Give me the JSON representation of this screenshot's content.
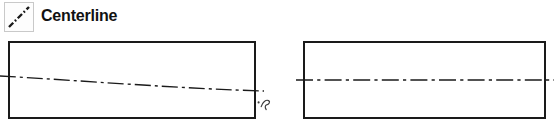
{
  "legend": {
    "swatch_icon": "centerline-dash-dot-diagonal-icon",
    "label": "Centerline",
    "line_color": "#1a1a1a",
    "swatch_border_color": "#c9c9c9",
    "swatch_fill_color": "#fdfdfd"
  },
  "drawing": {
    "outline_color": "#1a1a1a",
    "fill_color": "#ffffff",
    "centerline_color": "#1a1a1a",
    "annotation_color": "#3d3d3d",
    "figures": [
      {
        "name": "left-part-sloping-centerline",
        "caption": "",
        "rect": {
          "x": 9,
          "y": 6,
          "width": 246,
          "height": 76
        },
        "centerline_style": "dash-dot",
        "centerline_kind": "freehand-sloping",
        "centerline_start": {
          "x": 0,
          "y": 40
        },
        "centerline_end": {
          "x": 264,
          "y": 55
        },
        "annotation_mark": "squiggle-arrow"
      },
      {
        "name": "right-part-horizontal-centerline",
        "caption": "",
        "rect": {
          "x": 8,
          "y": 6,
          "width": 241,
          "height": 76
        },
        "centerline_style": "dash-dot",
        "centerline_kind": "straight-horizontal",
        "centerline_start": {
          "x": 0,
          "y": 44
        },
        "centerline_end": {
          "x": 258,
          "y": 44
        },
        "annotation_mark": ""
      }
    ]
  }
}
